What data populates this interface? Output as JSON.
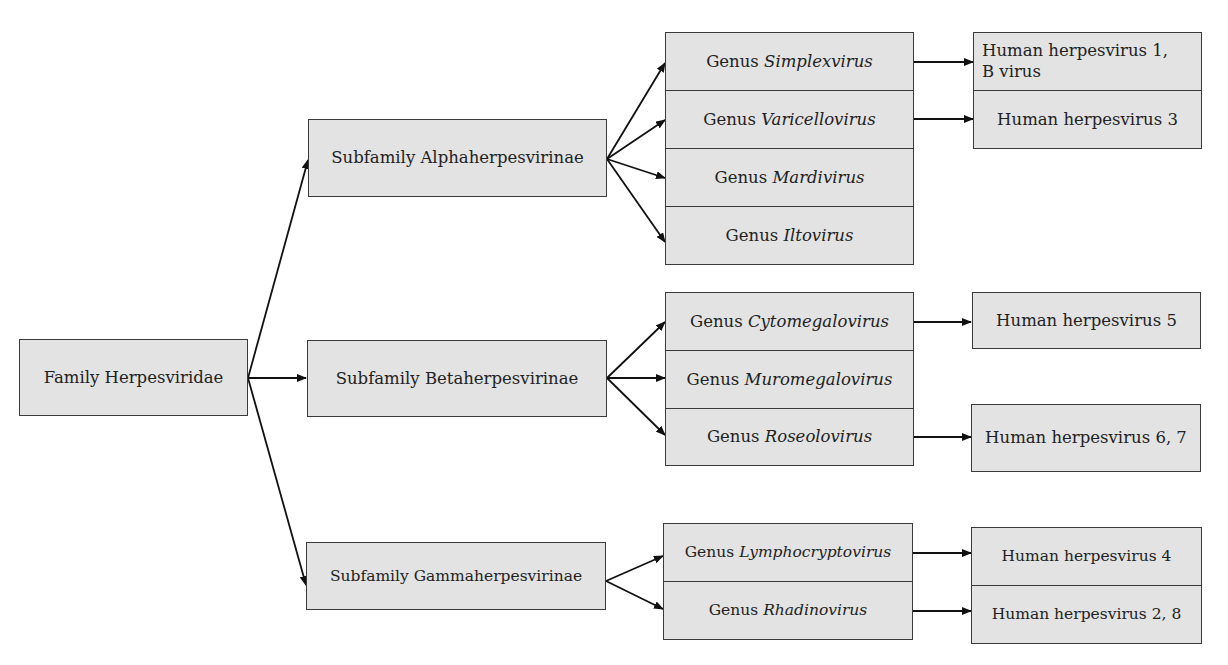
{
  "diagram": {
    "family": {
      "label": "Family Herpesviridae"
    },
    "subfamilies": [
      {
        "label": "Subfamily Alphaherpesvirinae",
        "genera": [
          {
            "prefix": "Genus ",
            "name": "Simplexvirus",
            "viruses": "Human herpesvirus 1,",
            "viruses_line2": "B virus"
          },
          {
            "prefix": "Genus ",
            "name": "Varicellovirus",
            "viruses": "Human herpesvirus 3"
          },
          {
            "prefix": "Genus ",
            "name": "Mardivirus"
          },
          {
            "prefix": "Genus ",
            "name": "Iltovirus"
          }
        ]
      },
      {
        "label": "Subfamily Betaherpesvirinae",
        "genera": [
          {
            "prefix": "Genus ",
            "name": "Cytomegalovirus",
            "viruses": "Human herpesvirus 5"
          },
          {
            "prefix": "Genus ",
            "name": "Muromegalovirus"
          },
          {
            "prefix": "Genus ",
            "name": "Roseolovirus",
            "viruses": "Human herpesvirus 6, 7"
          }
        ]
      },
      {
        "label": "Subfamily Gammaherpesvirinae",
        "genera": [
          {
            "prefix": "Genus ",
            "name": "Lymphocryptovirus",
            "viruses": "Human herpesvirus 4"
          },
          {
            "prefix": "Genus ",
            "name": "Rhadinovirus",
            "viruses": "Human herpesvirus 2, 8"
          }
        ]
      }
    ]
  },
  "colors": {
    "box_fill": "#e3e3e3",
    "border": "#3a3a3a",
    "line": "#111111"
  }
}
